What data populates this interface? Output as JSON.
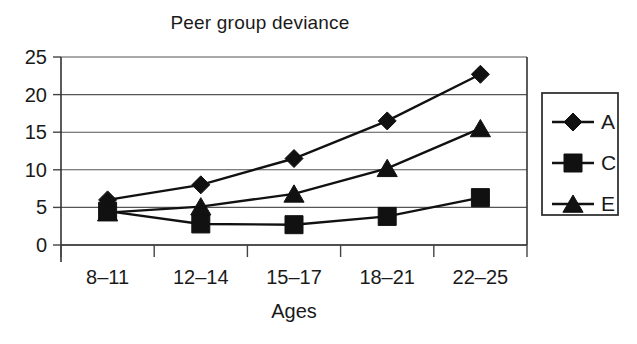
{
  "chart_data": {
    "type": "line",
    "title": "Peer group deviance",
    "xlabel": "Ages",
    "ylabel": "",
    "categories": [
      "8–11",
      "12–14",
      "15–17",
      "18–21",
      "22–25"
    ],
    "ylim": [
      0,
      25
    ],
    "yticks": [
      0,
      5,
      10,
      15,
      20,
      25
    ],
    "ytick_labels": [
      "0",
      "5",
      "10",
      "15",
      "20",
      "25"
    ],
    "grid": true,
    "legend_position": "right",
    "series": [
      {
        "name": "A",
        "marker": "diamond",
        "values": [
          6.0,
          8.0,
          11.5,
          16.5,
          22.7
        ]
      },
      {
        "name": "C",
        "marker": "square",
        "values": [
          4.5,
          2.8,
          2.7,
          3.8,
          6.3
        ]
      },
      {
        "name": "E",
        "marker": "triangle",
        "values": [
          4.3,
          5.1,
          6.8,
          10.2,
          15.5
        ]
      }
    ],
    "colors": {
      "ink": "#111111",
      "grid": "#555555",
      "axis": "#333333"
    }
  },
  "legend": {
    "entries": [
      {
        "label": "A",
        "marker": "diamond"
      },
      {
        "label": "C",
        "marker": "square"
      },
      {
        "label": "E",
        "marker": "triangle"
      }
    ]
  }
}
